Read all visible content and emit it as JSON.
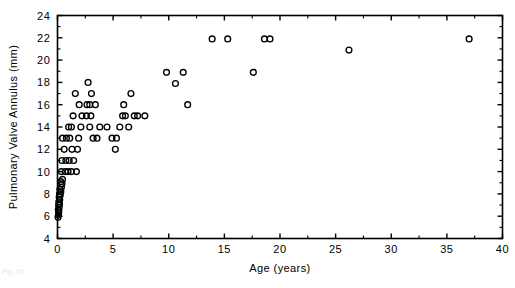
{
  "figure": {
    "caption_fragment": "Fig. 10."
  },
  "chart_data": {
    "type": "scatter",
    "title": "",
    "subtitle": "",
    "xlabel": "Age  (years)",
    "ylabel": "Pulmonary Valve Annulus (mm)",
    "xlim": [
      0,
      40
    ],
    "ylim": [
      4,
      24
    ],
    "x_major_ticks": [
      0,
      5,
      10,
      15,
      20,
      25,
      30,
      35,
      40
    ],
    "x_tick_labels": [
      "0",
      "5",
      "10",
      "15",
      "20",
      "25",
      "30",
      "35",
      "40"
    ],
    "x_minor_step": 2.5,
    "y_major_ticks": [
      4,
      6,
      8,
      10,
      12,
      14,
      16,
      18,
      20,
      22,
      24
    ],
    "y_tick_labels": [
      "4",
      "6",
      "8",
      "10",
      "12",
      "14",
      "16",
      "18",
      "20",
      "22",
      "24"
    ],
    "y_minor_step": 1,
    "grid": false,
    "legend": null,
    "marker": {
      "shape": "open-circle",
      "radius_px": 2.9,
      "color": "#000000",
      "fill": "none"
    },
    "series": [
      {
        "name": "Pulmonary valve annulus",
        "points": [
          [
            0.05,
            5.9
          ],
          [
            0.08,
            6.1
          ],
          [
            0.1,
            6.3
          ],
          [
            0.12,
            6.5
          ],
          [
            0.07,
            6.6
          ],
          [
            0.15,
            6.8
          ],
          [
            0.1,
            7.0
          ],
          [
            0.18,
            7.1
          ],
          [
            0.12,
            7.3
          ],
          [
            0.2,
            7.5
          ],
          [
            0.15,
            7.7
          ],
          [
            0.25,
            7.9
          ],
          [
            0.18,
            8.0
          ],
          [
            0.3,
            8.2
          ],
          [
            0.22,
            8.4
          ],
          [
            0.35,
            8.6
          ],
          [
            0.4,
            8.9
          ],
          [
            0.3,
            9.1
          ],
          [
            0.45,
            9.3
          ],
          [
            0.35,
            10.0
          ],
          [
            0.7,
            10.0
          ],
          [
            0.95,
            10.0
          ],
          [
            1.25,
            10.0
          ],
          [
            1.7,
            10.0
          ],
          [
            0.4,
            11.0
          ],
          [
            0.75,
            11.0
          ],
          [
            1.05,
            11.0
          ],
          [
            1.45,
            11.0
          ],
          [
            0.6,
            12.0
          ],
          [
            1.3,
            12.0
          ],
          [
            1.8,
            12.0
          ],
          [
            0.45,
            13.0
          ],
          [
            0.8,
            13.0
          ],
          [
            1.1,
            13.0
          ],
          [
            1.9,
            13.0
          ],
          [
            3.2,
            13.0
          ],
          [
            3.55,
            13.0
          ],
          [
            1.0,
            14.0
          ],
          [
            1.25,
            14.0
          ],
          [
            2.1,
            14.0
          ],
          [
            2.9,
            14.0
          ],
          [
            3.8,
            14.0
          ],
          [
            4.45,
            14.0
          ],
          [
            1.4,
            15.0
          ],
          [
            2.2,
            15.0
          ],
          [
            2.6,
            15.0
          ],
          [
            3.0,
            15.0
          ],
          [
            1.95,
            16.0
          ],
          [
            2.65,
            16.0
          ],
          [
            2.9,
            16.0
          ],
          [
            3.4,
            16.0
          ],
          [
            1.6,
            17.0
          ],
          [
            3.05,
            17.0
          ],
          [
            2.75,
            18.0
          ],
          [
            5.2,
            12.0
          ],
          [
            4.9,
            13.0
          ],
          [
            5.3,
            13.0
          ],
          [
            5.6,
            14.0
          ],
          [
            6.4,
            14.0
          ],
          [
            5.85,
            15.0
          ],
          [
            6.1,
            15.0
          ],
          [
            6.9,
            15.0
          ],
          [
            7.2,
            15.0
          ],
          [
            7.85,
            15.0
          ],
          [
            6.6,
            17.0
          ],
          [
            5.95,
            16.0
          ],
          [
            9.8,
            18.9
          ],
          [
            11.3,
            18.9
          ],
          [
            10.6,
            17.9
          ],
          [
            11.7,
            16.0
          ],
          [
            13.9,
            21.9
          ],
          [
            15.3,
            21.9
          ],
          [
            18.6,
            21.9
          ],
          [
            19.1,
            21.9
          ],
          [
            17.6,
            18.9
          ],
          [
            26.2,
            20.9
          ],
          [
            37.0,
            21.9
          ]
        ]
      }
    ]
  }
}
